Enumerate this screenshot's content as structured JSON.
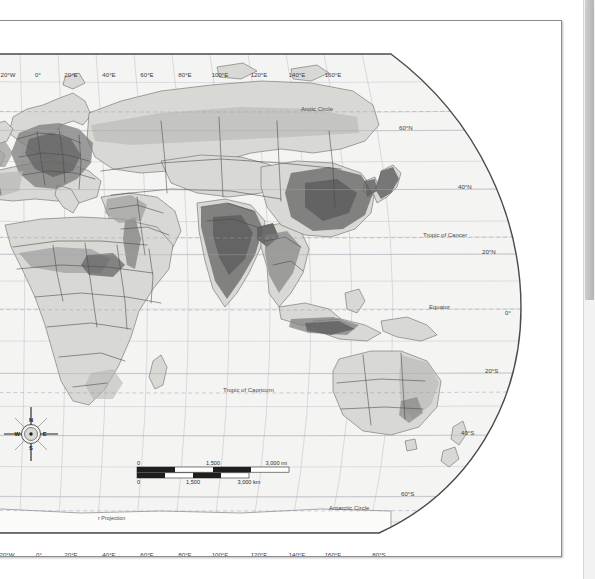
{
  "document": {
    "type": "scanned-map-page",
    "page_background": "#ffffff",
    "page_border_color": "#8c8c8c"
  },
  "scrollbar": {
    "name": "vertical-scrollbar",
    "track_color": "#f2f2f2",
    "thumb_color": "#bcbcbc"
  },
  "map": {
    "title": "",
    "projection_label": "r Projection",
    "hemisphere": "Eastern Hemisphere",
    "theme": "population density choropleth (grayscale)",
    "ocean_color": "#f4f4f2",
    "land_color": "#d8d8d4",
    "graticule_color": "#b9b9c4",
    "border_color": "#4a4a4a",
    "outline_color": "#555555",
    "density_shades": [
      "#e6e6e2",
      "#d2d2ce",
      "#b8b8b4",
      "#9a9a98",
      "#7c7c7c",
      "#5f5f60"
    ]
  },
  "longitude_labels_top": [
    {
      "label": "40°W",
      "x": 8
    },
    {
      "label": "20°W",
      "x": 47
    },
    {
      "label": "0°",
      "x": 77
    },
    {
      "label": "20°E",
      "x": 110
    },
    {
      "label": "40°E",
      "x": 148
    },
    {
      "label": "60°E",
      "x": 186
    },
    {
      "label": "80°E",
      "x": 224
    },
    {
      "label": "100°E",
      "x": 259
    },
    {
      "label": "120°E",
      "x": 298
    },
    {
      "label": "140°E",
      "x": 336
    },
    {
      "label": "160°E",
      "x": 372
    }
  ],
  "longitude_labels_bottom": [
    {
      "label": "40°W",
      "x": 8
    },
    {
      "label": "20°W",
      "x": 46
    },
    {
      "label": "0°",
      "x": 78
    },
    {
      "label": "20°E",
      "x": 110
    },
    {
      "label": "40°E",
      "x": 148
    },
    {
      "label": "60°E",
      "x": 186
    },
    {
      "label": "80°E",
      "x": 224
    },
    {
      "label": "100°E",
      "x": 259
    },
    {
      "label": "120°E",
      "x": 298
    },
    {
      "label": "140°E",
      "x": 336
    },
    {
      "label": "160°E",
      "x": 372
    },
    {
      "label": "80°S",
      "x": 418
    }
  ],
  "latitude_labels": [
    {
      "label": "60°N",
      "x": 438,
      "y": 109
    },
    {
      "label": "40°N",
      "x": 497,
      "y": 168
    },
    {
      "label": "20°N",
      "x": 521,
      "y": 233
    },
    {
      "label": "0°",
      "x": 544,
      "y": 294
    },
    {
      "label": "20°S",
      "x": 524,
      "y": 352
    },
    {
      "label": "40°S",
      "x": 500,
      "y": 414
    },
    {
      "label": "60°S",
      "x": 440,
      "y": 475
    }
  ],
  "reference_lines": [
    {
      "label": "Arctic Circle",
      "x": 340,
      "y": 90
    },
    {
      "label": "Tropic of Cancer",
      "x": 462,
      "y": 216
    },
    {
      "label": "Equator",
      "x": 468,
      "y": 288
    },
    {
      "label": "Tropic of Capricorn",
      "x": 262,
      "y": 371
    },
    {
      "label": "Antarctic Circle",
      "x": 368,
      "y": 489
    }
  ],
  "scale_bar": {
    "name": "scale-bar",
    "miles": {
      "unit": "mi",
      "ticks": [
        "0",
        "1,500",
        "3,000 mi"
      ]
    },
    "kilometers": {
      "unit": "km",
      "ticks": [
        "0",
        "1,500",
        "3,000 km"
      ]
    }
  },
  "compass_rose": {
    "name": "compass-rose",
    "north": "N",
    "east": "E",
    "south": "S",
    "west": "W"
  }
}
